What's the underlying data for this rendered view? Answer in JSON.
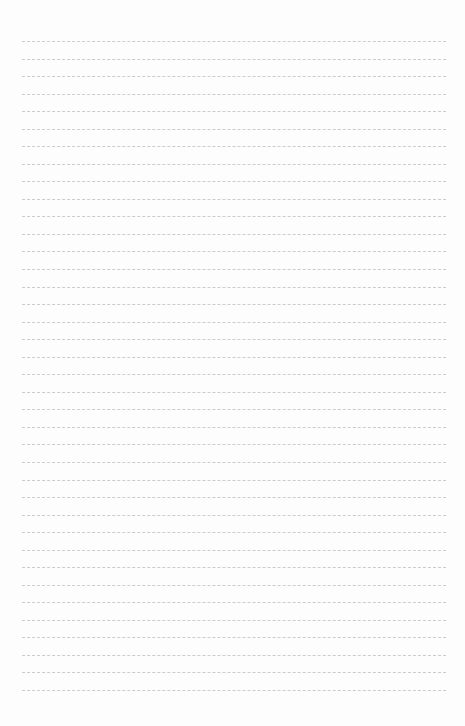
{
  "document": {
    "kind": "lined-paper-sheet",
    "title": "",
    "width_px": 465,
    "height_px": 726,
    "background_color": "#fdfdfd",
    "content_text": ""
  },
  "ruling": {
    "line_count": 38,
    "first_line_y": 41,
    "line_spacing_px": 17.54,
    "left_margin_px": 22,
    "right_margin_px": 19,
    "line_length_px": 424,
    "line_color": "#c9c9d0",
    "line_style": "dashed",
    "line_thickness_px": 1,
    "dash_length_px": 5,
    "dash_gap_px": 3
  },
  "lines": [
    {
      "index": 1,
      "text": ""
    },
    {
      "index": 2,
      "text": ""
    },
    {
      "index": 3,
      "text": ""
    },
    {
      "index": 4,
      "text": ""
    },
    {
      "index": 5,
      "text": ""
    },
    {
      "index": 6,
      "text": ""
    },
    {
      "index": 7,
      "text": ""
    },
    {
      "index": 8,
      "text": ""
    },
    {
      "index": 9,
      "text": ""
    },
    {
      "index": 10,
      "text": ""
    },
    {
      "index": 11,
      "text": ""
    },
    {
      "index": 12,
      "text": ""
    },
    {
      "index": 13,
      "text": ""
    },
    {
      "index": 14,
      "text": ""
    },
    {
      "index": 15,
      "text": ""
    },
    {
      "index": 16,
      "text": ""
    },
    {
      "index": 17,
      "text": ""
    },
    {
      "index": 18,
      "text": ""
    },
    {
      "index": 19,
      "text": ""
    },
    {
      "index": 20,
      "text": ""
    },
    {
      "index": 21,
      "text": ""
    },
    {
      "index": 22,
      "text": ""
    },
    {
      "index": 23,
      "text": ""
    },
    {
      "index": 24,
      "text": ""
    },
    {
      "index": 25,
      "text": ""
    },
    {
      "index": 26,
      "text": ""
    },
    {
      "index": 27,
      "text": ""
    },
    {
      "index": 28,
      "text": ""
    },
    {
      "index": 29,
      "text": ""
    },
    {
      "index": 30,
      "text": ""
    },
    {
      "index": 31,
      "text": ""
    },
    {
      "index": 32,
      "text": ""
    },
    {
      "index": 33,
      "text": ""
    },
    {
      "index": 34,
      "text": ""
    },
    {
      "index": 35,
      "text": ""
    },
    {
      "index": 36,
      "text": ""
    },
    {
      "index": 37,
      "text": ""
    },
    {
      "index": 38,
      "text": ""
    }
  ]
}
